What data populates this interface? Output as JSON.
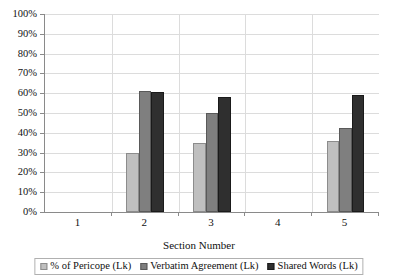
{
  "chart_data": {
    "type": "bar",
    "title": "",
    "subtitle": "",
    "xlabel": "Section Number",
    "ylabel": "",
    "categories": [
      "1",
      "2",
      "3",
      "4",
      "5"
    ],
    "series": [
      {
        "name": "% of Pericope (Lk)",
        "color": "#bfbfbf",
        "values": [
          0,
          30,
          35,
          0,
          36
        ]
      },
      {
        "name": "Verbatim Agreement (Lk)",
        "color": "#7f7f7f",
        "values": [
          0,
          61,
          50,
          0,
          42.5
        ]
      },
      {
        "name": "Shared Words (Lk)",
        "color": "#2f2f2f",
        "values": [
          0,
          60.5,
          58,
          0,
          59
        ]
      }
    ],
    "ylim": [
      0,
      100
    ],
    "ytick_labels": [
      "0%",
      "10%",
      "20%",
      "30%",
      "40%",
      "50%",
      "60%",
      "70%",
      "80%",
      "90%",
      "100%"
    ],
    "ytick_values": [
      0,
      10,
      20,
      30,
      40,
      50,
      60,
      70,
      80,
      90,
      100
    ],
    "grid": true,
    "grid_axis": "both",
    "legend_position": "bottom",
    "value_format": "percent"
  },
  "legend": {
    "entries": [
      {
        "label": "% of Pericope (Lk)",
        "swatch": "light-gray-swatch"
      },
      {
        "label": "Verbatim Agreement (Lk)",
        "swatch": "medium-gray-swatch"
      },
      {
        "label": "Shared Words (Lk)",
        "swatch": "dark-gray-swatch"
      }
    ]
  },
  "colors": {
    "series_light": "#bfbfbf",
    "series_medium": "#7f7f7f",
    "series_dark": "#2f2f2f",
    "gridline": "#dcdcdc",
    "axis": "#8a8a8a",
    "background": "#ffffff",
    "text": "#111111"
  }
}
